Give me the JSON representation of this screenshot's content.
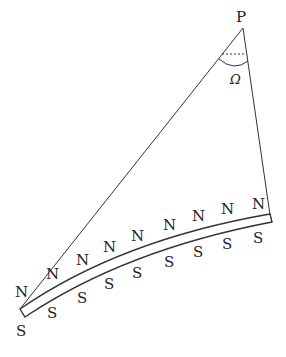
{
  "diagram": {
    "apex_label": "P",
    "angle_label": "Ω",
    "north_labels": [
      "N",
      "N",
      "N",
      "N",
      "N",
      "N",
      "N",
      "N",
      "N"
    ],
    "south_labels": [
      "S",
      "S",
      "S",
      "S",
      "S",
      "S",
      "S",
      "S",
      "S"
    ]
  }
}
